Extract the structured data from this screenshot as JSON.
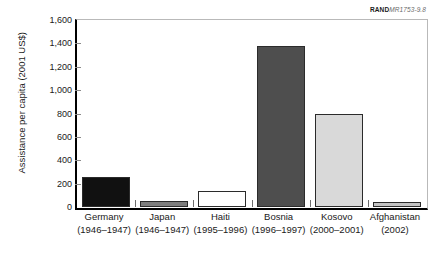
{
  "credit": {
    "brand": "RAND",
    "code": "MR1753-9.8"
  },
  "chart_data": {
    "type": "bar",
    "title": "",
    "xlabel": "",
    "ylabel": "Assistance per capita (2001 US$)",
    "ylim": [
      0,
      1600
    ],
    "yticks": [
      "0",
      "200",
      "400",
      "600",
      "800",
      "1,000",
      "1,200",
      "1,400",
      "1,600"
    ],
    "ytick_values": [
      0,
      200,
      400,
      600,
      800,
      1000,
      1200,
      1400,
      1600
    ],
    "grid": false,
    "legend": "none",
    "categories": [
      "Germany",
      "Japan",
      "Haiti",
      "Bosnia",
      "Kosovo",
      "Afghanistan"
    ],
    "category_periods": [
      "(1946–1947)",
      "(1946–1947)",
      "(1995–1996)",
      "(1996–1997)",
      "(2000–2001)",
      "(2002)"
    ],
    "values": [
      255,
      50,
      140,
      1380,
      800,
      40
    ],
    "bar_colors": [
      "#111111",
      "#7d7d7d",
      "#ffffff",
      "#4e4e4e",
      "#d9d9d9",
      "#c2c2c2"
    ],
    "bar_edge_color": "#2b2b2b"
  }
}
